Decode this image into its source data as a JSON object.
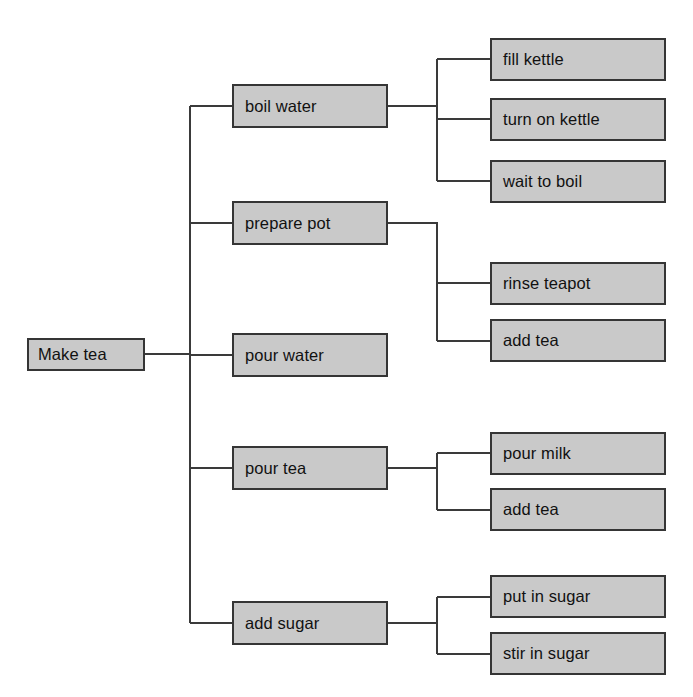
{
  "diagram": {
    "type": "hierarchical-task-analysis-tree",
    "orientation": "left-to-right",
    "colors": {
      "node_fill": "#c9c9c9",
      "node_border": "#353535",
      "connector": "#3a3a3a",
      "background": "#ffffff",
      "text": "#111111"
    },
    "root": {
      "label": "Make tea",
      "x": 27,
      "y": 338,
      "w": 118,
      "h": 33
    },
    "level2": [
      {
        "label": "boil water",
        "x": 232,
        "y": 84,
        "w": 156,
        "h": 44
      },
      {
        "label": "prepare pot",
        "x": 232,
        "y": 201,
        "w": 156,
        "h": 44
      },
      {
        "label": "pour water",
        "x": 232,
        "y": 333,
        "w": 156,
        "h": 44
      },
      {
        "label": "pour tea",
        "x": 232,
        "y": 446,
        "w": 156,
        "h": 44
      },
      {
        "label": "add sugar",
        "x": 232,
        "y": 601,
        "w": 156,
        "h": 44
      }
    ],
    "level3": [
      {
        "label": "fill kettle",
        "parent": "boil water",
        "x": 490,
        "y": 38,
        "w": 176,
        "h": 43
      },
      {
        "label": "turn on kettle",
        "parent": "boil water",
        "x": 490,
        "y": 98,
        "w": 176,
        "h": 43
      },
      {
        "label": "wait to boil",
        "parent": "boil water",
        "x": 490,
        "y": 160,
        "w": 176,
        "h": 43
      },
      {
        "label": "rinse teapot",
        "parent": "prepare pot",
        "x": 490,
        "y": 262,
        "w": 176,
        "h": 43
      },
      {
        "label": "add tea",
        "parent": "prepare pot",
        "x": 490,
        "y": 319,
        "w": 176,
        "h": 43
      },
      {
        "label": "pour milk",
        "parent": "pour tea",
        "x": 490,
        "y": 432,
        "w": 176,
        "h": 43
      },
      {
        "label": "add tea",
        "parent": "pour tea",
        "x": 490,
        "y": 488,
        "w": 176,
        "h": 43
      },
      {
        "label": "put in sugar",
        "parent": "add sugar",
        "x": 490,
        "y": 575,
        "w": 176,
        "h": 43
      },
      {
        "label": "stir in sugar",
        "parent": "add sugar",
        "x": 490,
        "y": 632,
        "w": 176,
        "h": 43
      }
    ],
    "connectors": {
      "root_trunk_x": 190,
      "branch_trunk_x": 437
    }
  }
}
